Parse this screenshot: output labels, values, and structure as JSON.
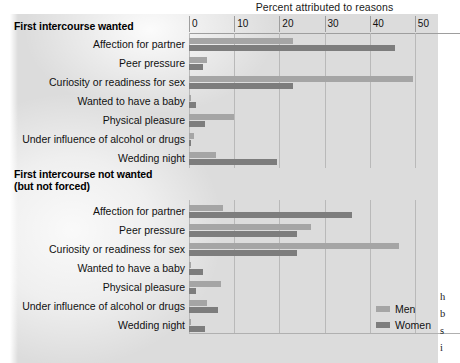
{
  "figure": {
    "axis_title": "Percent attributed to reasons",
    "sections": [
      {
        "title": "First intercourse wanted"
      },
      {
        "title_line1": "First intercourse not wanted",
        "title_line2": "(but not forced)"
      }
    ],
    "legend": {
      "men": "Men",
      "women": "Women"
    },
    "colors": {
      "men": "#a5a5a5",
      "women": "#7d7d7d",
      "background": "#dcdcdc",
      "grid": "#b9b9b9"
    },
    "edge_text": [
      "h",
      "b",
      "s",
      "i"
    ]
  },
  "chart_data": [
    {
      "type": "bar",
      "orientation": "horizontal",
      "title": "First intercourse wanted",
      "xlabel": "Percent attributed to reasons",
      "ylabel": "",
      "xlim": [
        0,
        60
      ],
      "xticks": [
        0,
        10,
        20,
        30,
        40,
        50,
        60
      ],
      "grid": true,
      "legend_position": "bottom-right",
      "categories": [
        "Affection for partner",
        "Peer pressure",
        "Curiosity or readiness for sex",
        "Wanted to have a baby",
        "Physical pleasure",
        "Under influence of alcohol or drugs",
        "Wedding night"
      ],
      "series": [
        {
          "name": "Men",
          "values": [
            23,
            4,
            49.5,
            0.5,
            10,
            1,
            6
          ]
        },
        {
          "name": "Women",
          "values": [
            45.5,
            3,
            23,
            1.5,
            3.5,
            0.5,
            19.5
          ]
        }
      ]
    },
    {
      "type": "bar",
      "orientation": "horizontal",
      "title": "First intercourse not wanted (but not forced)",
      "xlabel": "Percent attributed to reasons",
      "ylabel": "",
      "xlim": [
        0,
        60
      ],
      "xticks": [
        0,
        10,
        20,
        30,
        40,
        50,
        60
      ],
      "grid": true,
      "legend_position": "bottom-right",
      "categories": [
        "Affection for partner",
        "Peer pressure",
        "Curiosity or readiness for sex",
        "Wanted to have a baby",
        "Physical pleasure",
        "Under influence of alcohol or drugs",
        "Wedding night"
      ],
      "series": [
        {
          "name": "Men",
          "values": [
            7.5,
            27,
            46.5,
            0.5,
            7,
            4,
            0.5
          ]
        },
        {
          "name": "Women",
          "values": [
            36,
            24,
            24,
            3,
            1.5,
            6.5,
            3.5
          ]
        }
      ]
    }
  ]
}
